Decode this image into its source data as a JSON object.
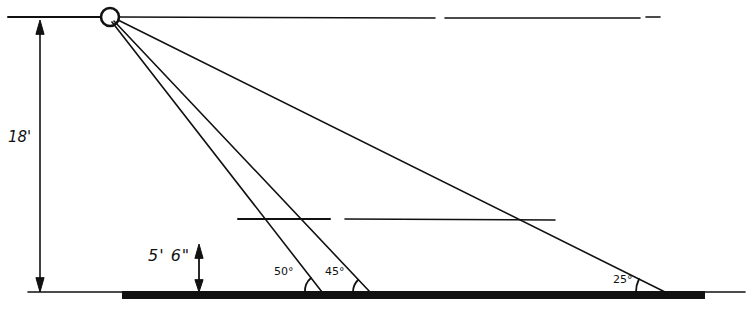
{
  "diagram": {
    "type": "lighting-angle-sketch",
    "colors": {
      "ink": "#111111",
      "background": "#ffffff"
    },
    "light_source": {
      "shape": "circle",
      "cx": 110,
      "cy": 17,
      "r": 10
    },
    "mounting_height": {
      "label": "18'"
    },
    "eye_height": {
      "label": "5' 6\""
    },
    "rays": [
      {
        "angle_label": "50°",
        "end_x": 322
      },
      {
        "angle_label": "45°",
        "end_x": 370
      },
      {
        "angle_label": "25°",
        "end_x": 665
      }
    ]
  }
}
